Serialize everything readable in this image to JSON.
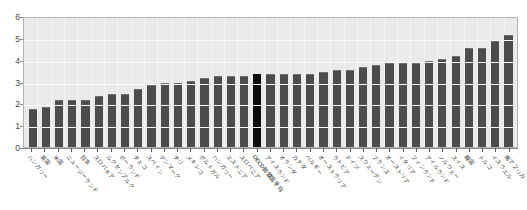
{
  "chart_data": {
    "type": "bar",
    "title": "",
    "subtitle": "",
    "xlabel": "",
    "ylabel": "",
    "ylim": [
      0,
      6
    ],
    "yticks": [
      "0",
      "1",
      "2",
      "3",
      "4",
      "5",
      "6"
    ],
    "grid": true,
    "legend": "none",
    "sorted": "ascending",
    "highlight_category": "OECD加盟国平均",
    "highlight_color": "#0d0d0d",
    "bar_color": "#4c4c4c",
    "plot_background": "#eaeaea",
    "categories": [
      "ハンガリー",
      "英国",
      "米国",
      "ニュージーランド",
      "日本",
      "スロバキア",
      "ルクセンブルク",
      "ポーランド",
      "チェコ",
      "スペイン",
      "デンマーク",
      "チリ",
      "メキシコ",
      "ポルトガル",
      "ハンガリー",
      "エストニア",
      "スロベニア",
      "OECD加盟国平均",
      "アイスランド",
      "オランダ",
      "カナダ",
      "ベルギー",
      "オーストラリア",
      "ラトビア",
      "ドイツ",
      "スウェーデン",
      "フランス",
      "オーストリア",
      "イタリア",
      "フィンランド",
      "アイルランド",
      "ノルウェー",
      "スイス",
      "韓国",
      "トルコ",
      "イスラエル",
      "南アフリカ"
    ],
    "values": [
      1.7,
      1.8,
      2.1,
      2.1,
      2.1,
      2.3,
      2.4,
      2.4,
      2.6,
      2.8,
      2.9,
      2.9,
      3.0,
      3.1,
      3.2,
      3.2,
      3.2,
      3.3,
      3.3,
      3.3,
      3.3,
      3.3,
      3.4,
      3.5,
      3.5,
      3.6,
      3.7,
      3.8,
      3.8,
      3.8,
      3.9,
      4.0,
      4.1,
      4.5,
      4.5,
      4.8,
      5.1
    ]
  }
}
